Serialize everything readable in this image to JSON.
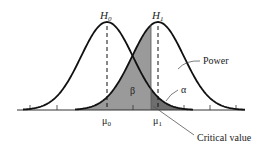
{
  "diagram": {
    "null_hypothesis_label": "H",
    "null_hypothesis_sub": "0",
    "alt_hypothesis_label": "H",
    "alt_hypothesis_sub": "1",
    "mu0_label": "μ",
    "mu0_sub": "0",
    "mu1_label": "μ",
    "mu1_sub": "1",
    "beta_label": "β",
    "alpha_label": "α",
    "power_label": "Power",
    "critical_value_label": "Critical value",
    "colors": {
      "curve": "#111111",
      "beta_fill": "#9a9a9a",
      "alpha_fill": "#6e6e6e",
      "axis": "#333333"
    }
  }
}
